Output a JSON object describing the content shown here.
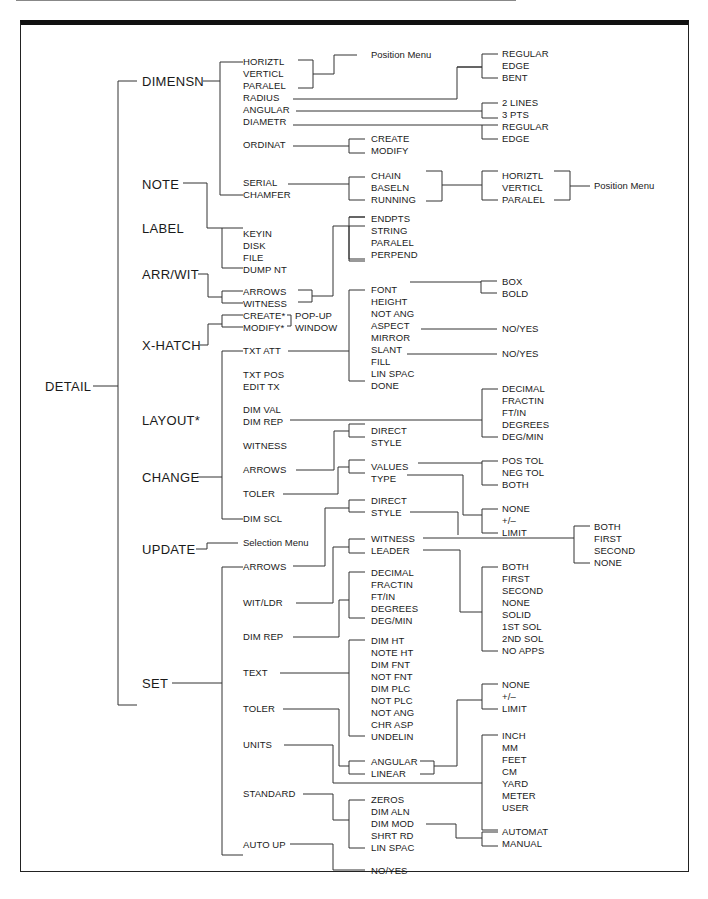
{
  "diagram": {
    "root": "DETAIL",
    "level1": [
      "DIMENSN",
      "NOTE",
      "LABEL",
      "ARR/WIT",
      "X-HATCH",
      "LAYOUT*",
      "CHANGE",
      "UPDATE",
      "SET"
    ],
    "dimensn": {
      "items": [
        "HORIZTL",
        "VERTICL",
        "PARALEL",
        "RADIUS",
        "ANGULAR",
        "DIAMETR",
        "ORDINAT",
        "SERIAL",
        "CHAMFER"
      ],
      "position_menu": "Position Menu",
      "radius_opts": [
        "REGULAR",
        "EDGE",
        "BENT"
      ],
      "angular_opts": [
        "2 LINES",
        "3 PTS"
      ],
      "diametr_opts": [
        "REGULAR",
        "EDGE"
      ],
      "ordinat_opts": [
        "CREATE",
        "MODIFY"
      ],
      "serial_opts": [
        "CHAIN",
        "BASELN",
        "RUNNING"
      ],
      "serial_dir": [
        "HORIZTL",
        "VERTICL",
        "PARALEL"
      ],
      "serial_position_menu": "Position Menu"
    },
    "label": {
      "items": [
        "KEYIN",
        "DISK",
        "FILE",
        "DUMP NT"
      ]
    },
    "arrwit": {
      "items": [
        "ARROWS",
        "WITNESS"
      ],
      "opts": [
        "ENDPTS",
        "STRING",
        "PARALEL",
        "PERPEND"
      ]
    },
    "xhatch": {
      "items": [
        "CREATE*",
        "MODIFY*"
      ],
      "popup": [
        "POP-UP",
        "WINDOW"
      ]
    },
    "change": {
      "items": [
        "TXT ATT",
        "TXT POS",
        "EDIT TX",
        "DIM VAL",
        "DIM REP",
        "WITNESS",
        "ARROWS",
        "TOLER",
        "DIM SCL"
      ],
      "txt_att_opts": [
        "FONT",
        "HEIGHT",
        "NOT ANG",
        "ASPECT",
        "MIRROR",
        "SLANT",
        "FILL",
        "LIN SPAC",
        "DONE"
      ],
      "font_opts": [
        "BOX",
        "BOLD"
      ],
      "mirror_opt": "NO/YES",
      "fill_opt": "NO/YES",
      "dim_rep_opts": [
        "DECIMAL",
        "FRACTIN",
        "FT/IN",
        "DEGREES",
        "DEG/MIN"
      ],
      "arrows_opts": [
        "DIRECT",
        "STYLE"
      ],
      "toler_opts": [
        "VALUES",
        "TYPE"
      ],
      "values_opts": [
        "POS TOL",
        "NEG TOL",
        "BOTH"
      ],
      "type_opts": [
        "NONE",
        "+/–",
        "LIMIT"
      ]
    },
    "update": {
      "item": "Selection Menu"
    },
    "set": {
      "items": [
        "ARROWS",
        "WIT/LDR",
        "DIM REP",
        "TEXT",
        "TOLER",
        "UNITS",
        "STANDARD",
        "AUTO UP"
      ],
      "arrows_opts": [
        "DIRECT",
        "STYLE"
      ],
      "witldr_opts": [
        "WITNESS",
        "LEADER"
      ],
      "witness_opts": [
        "BOTH",
        "FIRST",
        "SECOND",
        "NONE"
      ],
      "leader_opts": [
        "BOTH",
        "FIRST",
        "SECOND",
        "NONE",
        "SOLID",
        "1ST SOL",
        "2ND SOL",
        "NO APPS"
      ],
      "dim_rep_opts": [
        "DECIMAL",
        "FRACTIN",
        "FT/IN",
        "DEGREES",
        "DEG/MIN"
      ],
      "text_opts": [
        "DIM HT",
        "NOTE HT",
        "DIM FNT",
        "NOT FNT",
        "DIM PLC",
        "NOT PLC",
        "NOT ANG",
        "CHR ASP",
        "UNDELIN"
      ],
      "units_sub": [
        "ANGULAR",
        "LINEAR"
      ],
      "toler_opts": [
        "NONE",
        "+/–",
        "LIMIT"
      ],
      "units_opts": [
        "INCH",
        "MM",
        "FEET",
        "CM",
        "YARD",
        "METER",
        "USER"
      ],
      "standard_opts": [
        "ZEROS",
        "DIM ALN",
        "DIM MOD",
        "SHRT RD",
        "LIN SPAC"
      ],
      "dim_mod_opts": [
        "AUTOMAT",
        "MANUAL"
      ],
      "auto_up_opt": "NO/YES"
    }
  }
}
